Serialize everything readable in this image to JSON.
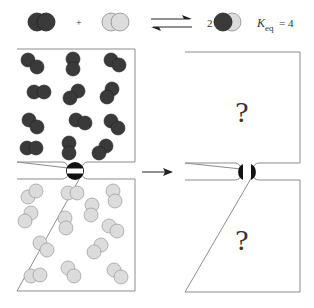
{
  "equation": {
    "reactant_a": "dark-molecule",
    "plus": "+",
    "reactant_b": "light-molecule",
    "arrow": "equilibrium-arrows",
    "coefficient": "2",
    "product": "mixed-molecule",
    "k_symbol": "K",
    "k_subscript": "eq",
    "k_equals": "= 4"
  },
  "colors": {
    "dark": "#3a3a3a",
    "dark_edge": "#222222",
    "light": "#dcdcdc",
    "light_edge": "#8a8a8a",
    "box": "#8c8c8c"
  },
  "left_panel": {
    "upper_box": "dark molecules",
    "lower_box": "light molecules",
    "valve_state": "closed"
  },
  "arrow_label": "",
  "right_panel": {
    "upper_box_label": "?",
    "lower_box_label": "?",
    "valve_state": "open"
  }
}
